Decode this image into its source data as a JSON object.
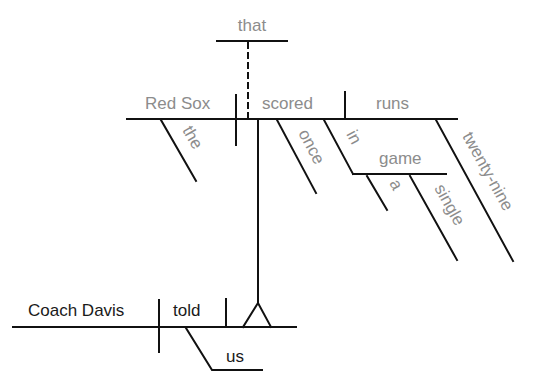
{
  "diagram": {
    "type": "Reed-Kellogg sentence diagram",
    "colors": {
      "subordinate_text": "#8c8c8c",
      "main_text": "#1a1a1a",
      "lines": "#111111"
    },
    "main_clause": {
      "subject": "Coach Davis",
      "verb": "told",
      "indirect_object": "us"
    },
    "noun_clause": {
      "connector": "that",
      "subject": "Red Sox",
      "subject_modifier": "the",
      "verb": "scored",
      "verb_modifiers": [
        "once"
      ],
      "prepositional_phrase": {
        "preposition": "in",
        "object": "game",
        "modifiers": [
          "a",
          "single"
        ]
      },
      "direct_object": "runs",
      "object_modifier": "twenty-nine"
    }
  }
}
